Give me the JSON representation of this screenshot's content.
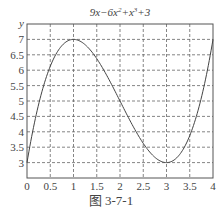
{
  "chart_data": {
    "type": "line",
    "xlabel": "",
    "ylabel": "y",
    "xlim": [
      0,
      4
    ],
    "ylim": [
      2.5,
      7.5
    ],
    "grid": true,
    "x_ticks": [
      "0",
      "0.5",
      "1",
      "1.5",
      "2",
      "2.5",
      "3",
      "3.5",
      "4"
    ],
    "y_ticks": [
      "3",
      "3.5",
      "4",
      "4.5",
      "5",
      "5.5",
      "6",
      "6.5",
      "7"
    ],
    "series": [
      {
        "name": "9x-6x^2+x^3+3",
        "x": [
          0,
          0.25,
          0.5,
          0.75,
          1,
          1.25,
          1.5,
          1.75,
          2,
          2.25,
          2.5,
          2.75,
          3,
          3.25,
          3.5,
          3.75,
          4
        ],
        "values": [
          3,
          4.891,
          6.125,
          6.797,
          7,
          6.828,
          6.375,
          5.734,
          5,
          4.266,
          3.625,
          3.172,
          3,
          3.203,
          3.875,
          5.109,
          7
        ]
      }
    ]
  },
  "title_parts": {
    "a": "9x−6x",
    "b": "2",
    "c": "+x",
    "d": "3",
    "e": "+3"
  },
  "caption": "图 3-7-1"
}
